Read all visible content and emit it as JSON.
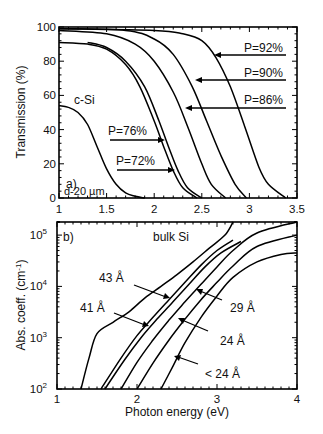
{
  "chart_data": [
    {
      "type": "line",
      "panel": "a)",
      "title": "",
      "xlabel": "",
      "ylabel": "Transmission (%)",
      "xlim": [
        1,
        3.5
      ],
      "ylim": [
        0,
        100
      ],
      "xticks": [
        "1",
        "1.5",
        "2",
        "2.5",
        "3",
        "3.5"
      ],
      "yticks": [
        "0",
        "20",
        "40",
        "60",
        "80",
        "100"
      ],
      "annotations": [
        "c-Si",
        "a)",
        "d-20 µm",
        "P=92%",
        "P=90%",
        "P=86%",
        "P=76%",
        "P=72%"
      ],
      "series": [
        {
          "name": "d-20 µm",
          "x": [
            1.0,
            1.1,
            1.2,
            1.3,
            1.4,
            1.5,
            1.6,
            1.7,
            1.8,
            1.9
          ],
          "y": [
            54,
            53,
            50,
            43,
            30,
            17,
            8,
            3,
            1,
            0
          ]
        },
        {
          "name": "P=72%",
          "x": [
            1.0,
            1.3,
            1.5,
            1.7,
            1.85,
            2.0,
            2.1,
            2.2,
            2.3,
            2.45
          ],
          "y": [
            91,
            90,
            87,
            78,
            65,
            45,
            30,
            16,
            6,
            0
          ]
        },
        {
          "name": "P=76%",
          "x": [
            1.3,
            1.5,
            1.7,
            1.9,
            2.05,
            2.15,
            2.25,
            2.35,
            2.5
          ],
          "y": [
            91,
            88,
            80,
            65,
            45,
            30,
            16,
            6,
            0
          ]
        },
        {
          "name": "P=86%",
          "x": [
            1.0,
            1.5,
            1.8,
            2.0,
            2.2,
            2.35,
            2.5,
            2.6,
            2.75
          ],
          "y": [
            98,
            96,
            90,
            80,
            62,
            42,
            20,
            8,
            0
          ]
        },
        {
          "name": "P=90%",
          "x": [
            1.0,
            1.7,
            2.0,
            2.2,
            2.4,
            2.55,
            2.7,
            2.85,
            2.97
          ],
          "y": [
            99,
            98,
            93,
            84,
            65,
            45,
            25,
            8,
            0
          ]
        },
        {
          "name": "P=92%",
          "x": [
            1.0,
            2.0,
            2.3,
            2.5,
            2.65,
            2.8,
            2.95,
            3.1,
            3.2,
            3.38
          ],
          "y": [
            99,
            98,
            96,
            92,
            82,
            65,
            42,
            18,
            8,
            0
          ]
        }
      ]
    },
    {
      "type": "line",
      "panel": "b)",
      "title": "",
      "xlabel": "Photon energy (eV)",
      "ylabel": "Abs. coeff. (cm⁻¹)",
      "yscale": "log",
      "xlim": [
        1,
        4
      ],
      "ylim": [
        100,
        200000
      ],
      "xticks": [
        "1",
        "2",
        "3",
        "4"
      ],
      "yticks": [
        "10²",
        "10³",
        "10⁴",
        "10⁵"
      ],
      "annotations": [
        "b)",
        "bulk Si",
        "43 Å",
        "41 Å",
        "29 Å",
        "24 Å",
        "< 24 Å"
      ],
      "series": [
        {
          "name": "bulk Si",
          "x": [
            1.3,
            1.4,
            1.5,
            1.7,
            1.9,
            2.1,
            2.3,
            2.5,
            2.7,
            2.9,
            3.1,
            3.2
          ],
          "y": [
            100,
            400,
            1200,
            2000,
            3200,
            6000,
            10000,
            17000,
            30000,
            55000,
            100000,
            200000
          ]
        },
        {
          "name": "43 Å",
          "x": [
            1.55,
            1.8,
            2.0,
            2.2,
            2.4,
            2.6,
            2.8,
            3.0,
            3.2
          ],
          "y": [
            100,
            400,
            1100,
            2500,
            5500,
            12000,
            26000,
            50000,
            80000
          ]
        },
        {
          "name": "41 Å",
          "x": [
            1.6,
            1.85,
            2.05,
            2.25,
            2.45,
            2.65,
            2.85,
            3.05,
            3.3
          ],
          "y": [
            100,
            380,
            1000,
            2300,
            5000,
            11000,
            24000,
            45000,
            75000
          ]
        },
        {
          "name": "29 Å",
          "x": [
            1.8,
            2.0,
            2.2,
            2.4,
            2.6,
            2.8,
            3.0,
            3.2,
            3.5,
            4.0
          ],
          "y": [
            100,
            330,
            900,
            2200,
            5000,
            11000,
            24000,
            50000,
            110000,
            180000
          ]
        },
        {
          "name": "24 Å",
          "x": [
            2.0,
            2.2,
            2.4,
            2.6,
            2.8,
            3.0,
            3.2,
            3.5,
            4.0
          ],
          "y": [
            100,
            320,
            900,
            2300,
            5500,
            12000,
            25000,
            60000,
            100000
          ]
        },
        {
          "name": "< 24 Å",
          "x": [
            2.3,
            2.45,
            2.6,
            2.8,
            3.0,
            3.2,
            3.5,
            3.8,
            4.0
          ],
          "y": [
            100,
            280,
            800,
            2500,
            6500,
            15000,
            30000,
            42000,
            45000
          ]
        }
      ]
    }
  ],
  "panel_a": {
    "ylabel": "Transmission (%)",
    "xticks": [
      "1",
      "1.5",
      "2",
      "2.5",
      "3",
      "3.5"
    ],
    "yticks": [
      "0",
      "20",
      "40",
      "60",
      "80",
      "100"
    ],
    "label_csi": "c-Si",
    "label_panel": "a)",
    "label_thickness": "d-20 µm",
    "p92": "P=92%",
    "p90": "P=90%",
    "p86": "P=86%",
    "p76": "P=76%",
    "p72": "P=72%"
  },
  "panel_b": {
    "xlabel": "Photon energy (eV)",
    "ylabel": "Abs. coeff. (cm",
    "ylabel_sup": "-1",
    "ylabel_end": ")",
    "xticks": [
      "1",
      "2",
      "3",
      "4"
    ],
    "ytick_base": "10",
    "ytick_exps": [
      "2",
      "3",
      "4",
      "5"
    ],
    "label_panel": "b)",
    "label_bulk": "bulk Si",
    "l43": "43 Å",
    "l41": "41 Å",
    "l29": "29 Å",
    "l24": "24 Å",
    "llt24": "< 24 Å"
  }
}
